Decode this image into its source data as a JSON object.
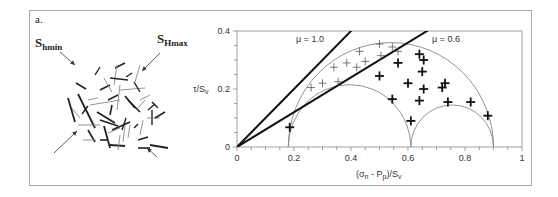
{
  "panel_label": "a.",
  "schematic": {
    "label_shmin_base": "S",
    "label_shmin_sub": "hmin",
    "label_shmax_base": "S",
    "label_shmax_sub": "Hmax",
    "fractures": [
      [
        100,
        90,
        110,
        85,
        "#222",
        1.6
      ],
      [
        76,
        83,
        86,
        89,
        "#222",
        1.6
      ],
      [
        115,
        68,
        125,
        63,
        "#222",
        1.6
      ],
      [
        95,
        75,
        100,
        67,
        "#222",
        1.4
      ],
      [
        104,
        78,
        112,
        92,
        "#888",
        0.9
      ],
      [
        117,
        65,
        114,
        85,
        "#888",
        0.9
      ],
      [
        126,
        77,
        132,
        73,
        "#222",
        1.4
      ],
      [
        110,
        78,
        128,
        80,
        "#222",
        1.6
      ],
      [
        140,
        65,
        135,
        82,
        "#888",
        0.9
      ],
      [
        120,
        90,
        145,
        88,
        "#888",
        0.9
      ],
      [
        68,
        98,
        75,
        122,
        "#222",
        1.8
      ],
      [
        78,
        94,
        95,
        128,
        "#222",
        1.8
      ],
      [
        72,
        108,
        80,
        118,
        "#888",
        0.9
      ],
      [
        82,
        114,
        88,
        106,
        "#222",
        1.4
      ],
      [
        90,
        105,
        120,
        100,
        "#888",
        0.9
      ],
      [
        97,
        112,
        115,
        123,
        "#222",
        1.8
      ],
      [
        108,
        100,
        118,
        95,
        "#222",
        1.4
      ],
      [
        120,
        85,
        117,
        110,
        "#888",
        0.9
      ],
      [
        125,
        96,
        135,
        108,
        "#222",
        1.8
      ],
      [
        128,
        100,
        140,
        112,
        "#222",
        1.6
      ],
      [
        140,
        100,
        150,
        95,
        "#888",
        0.9
      ],
      [
        134,
        82,
        140,
        92,
        "#222",
        1.4
      ],
      [
        148,
        110,
        155,
        104,
        "#222",
        1.4
      ],
      [
        152,
        110,
        152,
        125,
        "#222",
        1.4
      ],
      [
        147,
        118,
        160,
        118,
        "#888",
        0.9
      ],
      [
        112,
        105,
        110,
        115,
        "#222",
        1.6
      ],
      [
        100,
        120,
        118,
        126,
        "#222",
        1.8
      ],
      [
        88,
        130,
        95,
        142,
        "#222",
        1.6
      ],
      [
        104,
        126,
        110,
        148,
        "#222",
        1.8
      ],
      [
        78,
        125,
        100,
        125,
        "#888",
        0.9
      ],
      [
        108,
        133,
        120,
        128,
        "#888",
        0.9
      ],
      [
        112,
        130,
        130,
        122,
        "#222",
        1.8
      ],
      [
        126,
        118,
        122,
        130,
        "#222",
        1.4
      ],
      [
        143,
        120,
        140,
        135,
        "#888",
        0.9
      ],
      [
        134,
        128,
        138,
        124,
        "#222",
        1.4
      ],
      [
        138,
        140,
        148,
        137,
        "#222",
        1.6
      ],
      [
        125,
        125,
        123,
        142,
        "#888",
        0.9
      ],
      [
        155,
        118,
        165,
        112,
        "#222",
        1.6
      ],
      [
        100,
        140,
        108,
        140,
        "#222",
        1.6
      ],
      [
        110,
        145,
        125,
        146,
        "#222",
        1.8
      ],
      [
        138,
        148,
        150,
        148,
        "#222",
        1.6
      ],
      [
        150,
        145,
        168,
        148,
        "#222",
        1.8
      ],
      [
        88,
        100,
        98,
        98,
        "#888",
        0.9
      ],
      [
        145,
        100,
        138,
        108,
        "#888",
        0.9
      ],
      [
        130,
        125,
        128,
        138,
        "#888",
        0.9
      ],
      [
        83,
        140,
        96,
        140,
        "#888",
        0.9
      ],
      [
        120,
        135,
        118,
        150,
        "#888",
        0.9
      ],
      [
        152,
        102,
        158,
        108,
        "#222",
        1.4
      ]
    ],
    "arrows": [
      {
        "name": "shmin-arrow-top-left",
        "x1": 60,
        "y1": 52,
        "x2": 75,
        "y2": 65
      },
      {
        "name": "shmax-arrow-top-right",
        "x1": 160,
        "y1": 53,
        "x2": 142,
        "y2": 71
      },
      {
        "name": "shmax-arrow-bottom-left",
        "x1": 54,
        "y1": 153,
        "x2": 77,
        "y2": 131
      },
      {
        "name": "shmin-arrow-bottom-right",
        "x1": 157,
        "y1": 157,
        "x2": 147,
        "y2": 148
      }
    ]
  },
  "chart_data": {
    "type": "scatter",
    "title": "",
    "xlabel": "(σn - Pp)/Sv",
    "ylabel": "τ/Sv",
    "xlim": [
      0,
      1
    ],
    "ylim": [
      0,
      0.4
    ],
    "x_ticks": [
      "0",
      "0.2",
      "0.4",
      "0.6",
      "0.8",
      "1"
    ],
    "y_ticks": [
      "0",
      "0.2",
      "0.4"
    ],
    "grid": false,
    "legend": null,
    "lines": [
      {
        "name": "μ = 1.0",
        "slope": 1.0,
        "label": "μ = 1.0"
      },
      {
        "name": "μ = 0.6",
        "slope": 0.6,
        "label": "μ = 0.6"
      }
    ],
    "mohr_circles": [
      {
        "name": "outer",
        "sigma3": 0.18,
        "sigma1": 0.9
      },
      {
        "name": "left-inner",
        "sigma3": 0.18,
        "sigma1": 0.61
      },
      {
        "name": "right-inner",
        "sigma3": 0.61,
        "sigma1": 0.9
      }
    ],
    "series": [
      {
        "name": "non-critically stressed fractures (thin)",
        "points": [
          [
            0.26,
            0.205
          ],
          [
            0.3,
            0.22
          ],
          [
            0.355,
            0.225
          ],
          [
            0.34,
            0.275
          ],
          [
            0.385,
            0.29
          ],
          [
            0.42,
            0.275
          ],
          [
            0.45,
            0.295
          ],
          [
            0.43,
            0.33
          ],
          [
            0.505,
            0.315
          ],
          [
            0.5,
            0.355
          ],
          [
            0.565,
            0.33
          ],
          [
            0.545,
            0.345
          ]
        ]
      },
      {
        "name": "critically stressed fractures (bold)",
        "points": [
          [
            0.185,
            0.068
          ],
          [
            0.5,
            0.245
          ],
          [
            0.565,
            0.29
          ],
          [
            0.6,
            0.22
          ],
          [
            0.545,
            0.165
          ],
          [
            0.61,
            0.09
          ],
          [
            0.64,
            0.16
          ],
          [
            0.64,
            0.32
          ],
          [
            0.655,
            0.2
          ],
          [
            0.65,
            0.26
          ],
          [
            0.73,
            0.22
          ],
          [
            0.72,
            0.205
          ],
          [
            0.74,
            0.155
          ],
          [
            0.82,
            0.155
          ],
          [
            0.88,
            0.108
          ],
          [
            0.655,
            0.3
          ]
        ]
      }
    ]
  }
}
